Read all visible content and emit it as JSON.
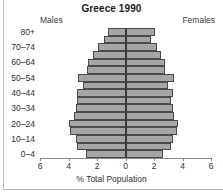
{
  "chart_data": {
    "type": "bar",
    "subtype": "population-pyramid",
    "title": "Greece 1990",
    "xlabel": "% Total Population",
    "ylabel": "",
    "left_label": "Males",
    "right_label": "Females",
    "xlim": [
      -6,
      6
    ],
    "xticks": [
      6,
      4,
      2,
      0,
      2,
      4,
      6
    ],
    "xtick_values": [
      -6,
      -4,
      -2,
      0,
      2,
      4,
      6
    ],
    "grid": false,
    "legend": "none",
    "bar_fill_color": "#a6a6a6",
    "bar_edge_color": "#4a4a4a",
    "categories": [
      "0–4",
      "5–9",
      "10–14",
      "15–19",
      "20–24",
      "25–29",
      "30–34",
      "35–39",
      "40–44",
      "45–49",
      "50–54",
      "55–59",
      "60–64",
      "65–69",
      "70–74",
      "75–79",
      "80+"
    ],
    "visible_ytick_labels": [
      "0–4",
      "10–14",
      "20–24",
      "30–34",
      "40–44",
      "50–54",
      "60–64",
      "70–74",
      "80+"
    ],
    "series": [
      {
        "name": "Males",
        "side": "left",
        "values": [
          2.8,
          3.4,
          3.5,
          3.9,
          4.0,
          3.6,
          3.5,
          3.4,
          3.4,
          3.0,
          3.3,
          2.7,
          2.6,
          2.3,
          1.9,
          1.5,
          1.2
        ]
      },
      {
        "name": "Females",
        "side": "right",
        "values": [
          2.6,
          3.2,
          3.3,
          3.6,
          3.7,
          3.4,
          3.3,
          3.2,
          3.3,
          3.0,
          3.4,
          2.8,
          2.8,
          2.5,
          2.2,
          1.8,
          2.1
        ]
      }
    ]
  }
}
